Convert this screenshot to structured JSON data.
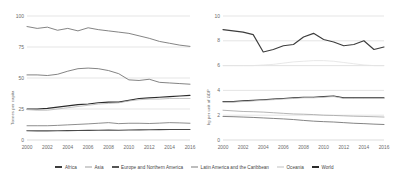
{
  "legend": {
    "items": [
      {
        "label": "Africa",
        "color": "#3d3d3d"
      },
      {
        "label": "Asia",
        "color": "#cfcfcf"
      },
      {
        "label": "Europe and Northern America",
        "color": "#555555"
      },
      {
        "label": "Latin America and the Caribbean",
        "color": "#bdbdbd"
      },
      {
        "label": "Oceania",
        "color": "#e0e0e0"
      },
      {
        "label": "World",
        "color": "#2b2b2b"
      }
    ]
  },
  "chart_data": [
    {
      "type": "line",
      "title": "",
      "xlabel": "",
      "ylabel": "Tonnes per capita",
      "x": [
        2000,
        2001,
        2002,
        2003,
        2004,
        2005,
        2006,
        2007,
        2008,
        2009,
        2010,
        2011,
        2012,
        2013,
        2014,
        2015,
        2016
      ],
      "xticks": [
        "2000",
        "2002",
        "2004",
        "2006",
        "2008",
        "2010",
        "2012",
        "2014",
        "2016"
      ],
      "yticks": [
        "0",
        "25",
        "50",
        "75",
        "100"
      ],
      "ylim": [
        0,
        100
      ],
      "xlim": [
        2000,
        2016
      ],
      "grid": true,
      "legend_position": "bottom",
      "series": [
        {
          "name": "Europe and Northern America",
          "color": "#6e6e6e",
          "values": [
            91.5,
            90.0,
            91.0,
            88.5,
            90.0,
            88.0,
            90.5,
            89.0,
            88.0,
            87.0,
            86.0,
            84.0,
            82.0,
            79.5,
            78.0,
            76.5,
            75.5
          ]
        },
        {
          "name": "Oceania",
          "color": "#6e6e6e",
          "values": [
            52.5,
            52.5,
            52.0,
            53.0,
            55.5,
            57.5,
            58.0,
            57.5,
            56.0,
            53.5,
            48.5,
            48.0,
            49.0,
            46.5,
            46.0,
            45.5,
            45.0
          ]
        },
        {
          "name": "World",
          "color": "#2b2b2b",
          "values": [
            25.0,
            25.0,
            25.5,
            26.5,
            27.5,
            28.5,
            29.0,
            30.0,
            30.5,
            30.5,
            32.0,
            33.5,
            34.0,
            34.5,
            35.0,
            35.5,
            36.0
          ]
        },
        {
          "name": "Asia",
          "color": "#b9b9b9",
          "values": [
            24.5,
            24.0,
            24.0,
            25.0,
            26.0,
            27.0,
            28.0,
            29.0,
            29.5,
            30.0,
            31.5,
            32.5,
            33.0,
            33.0,
            33.5,
            33.5,
            33.5
          ]
        },
        {
          "name": "Latin America and the Caribbean",
          "color": "#7a7a7a",
          "values": [
            11.5,
            11.5,
            11.5,
            11.8,
            12.2,
            12.6,
            13.0,
            13.5,
            14.0,
            13.2,
            13.5,
            13.5,
            13.3,
            13.6,
            14.0,
            13.8,
            13.5
          ]
        },
        {
          "name": "Africa",
          "color": "#4a4a4a",
          "values": [
            7.5,
            7.4,
            7.4,
            7.5,
            7.6,
            7.7,
            7.8,
            7.9,
            8.0,
            7.9,
            8.1,
            8.2,
            8.3,
            8.4,
            8.5,
            8.5,
            8.5
          ]
        }
      ]
    },
    {
      "type": "line",
      "title": "",
      "xlabel": "",
      "ylabel": "kg per unit of GDP",
      "x": [
        2000,
        2001,
        2002,
        2003,
        2004,
        2005,
        2006,
        2007,
        2008,
        2009,
        2010,
        2011,
        2012,
        2013,
        2014,
        2015,
        2016
      ],
      "xticks": [
        "2000",
        "2002",
        "2004",
        "2006",
        "2008",
        "2010",
        "2012",
        "2014",
        "2016"
      ],
      "yticks": [
        "0",
        "2",
        "4",
        "6",
        "8",
        "10"
      ],
      "ylim": [
        0,
        10
      ],
      "xlim": [
        2000,
        2016
      ],
      "grid": true,
      "legend_position": "bottom",
      "series": [
        {
          "name": "Africa",
          "color": "#3d3d3d",
          "values": [
            8.9,
            8.8,
            8.7,
            8.5,
            7.1,
            7.3,
            7.6,
            7.7,
            8.3,
            8.6,
            8.1,
            7.9,
            7.6,
            7.7,
            8.0,
            7.3,
            7.5
          ]
        },
        {
          "name": "Oceania",
          "color": "#e4e4e4",
          "values": [
            6.0,
            6.0,
            6.0,
            6.0,
            6.05,
            6.1,
            6.2,
            6.3,
            6.35,
            6.4,
            6.4,
            6.35,
            6.25,
            6.15,
            6.05,
            6.0,
            6.0
          ]
        },
        {
          "name": "World",
          "color": "#2b2b2b",
          "values": [
            3.1,
            3.1,
            3.15,
            3.2,
            3.25,
            3.3,
            3.35,
            3.4,
            3.45,
            3.45,
            3.5,
            3.55,
            3.4,
            3.4,
            3.4,
            3.4,
            3.4
          ]
        },
        {
          "name": "Asia",
          "color": "#c9c9c9",
          "values": [
            3.05,
            3.05,
            3.1,
            3.15,
            3.2,
            3.25,
            3.3,
            3.35,
            3.4,
            3.4,
            3.45,
            3.5,
            3.35,
            3.35,
            3.35,
            3.35,
            3.35
          ]
        },
        {
          "name": "Latin America and the Caribbean",
          "color": "#a8a8a8",
          "values": [
            2.4,
            2.35,
            2.3,
            2.28,
            2.25,
            2.2,
            2.15,
            2.1,
            2.08,
            2.05,
            2.0,
            1.98,
            1.95,
            1.92,
            1.9,
            1.88,
            1.85
          ]
        },
        {
          "name": "Europe and Northern America",
          "color": "#6e6e6e",
          "values": [
            1.9,
            1.88,
            1.85,
            1.82,
            1.78,
            1.74,
            1.7,
            1.65,
            1.58,
            1.52,
            1.48,
            1.45,
            1.4,
            1.35,
            1.32,
            1.28,
            1.25
          ]
        }
      ]
    }
  ]
}
